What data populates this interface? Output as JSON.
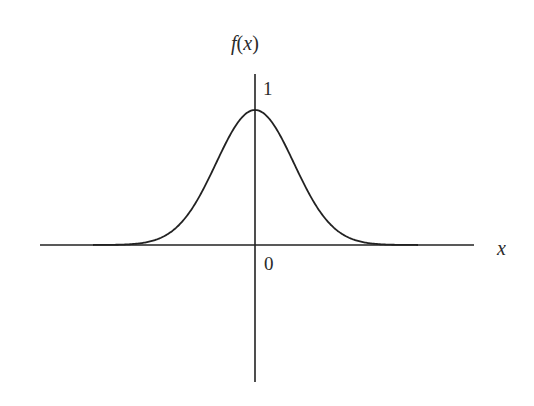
{
  "chart_data": {
    "type": "line",
    "title": "",
    "xlabel": "x",
    "ylabel": "f(x)",
    "function": "f(x) = exp(-x^2) (bell-shaped curve)",
    "peak": {
      "x": 0,
      "y": 1
    },
    "tick_labels": {
      "origin": "0",
      "peak": "1"
    },
    "x": [
      -3,
      -2.5,
      -2,
      -1.5,
      -1,
      -0.5,
      0,
      0.5,
      1,
      1.5,
      2,
      2.5,
      3
    ],
    "series": [
      {
        "name": "f(x)",
        "values": [
          0.0001,
          0.0019,
          0.018,
          0.105,
          0.368,
          0.779,
          1.0,
          0.779,
          0.368,
          0.105,
          0.018,
          0.0019,
          0.0001
        ]
      }
    ],
    "xlim": [
      -4.2,
      4.2
    ],
    "ylim": [
      -1.0,
      1.2
    ],
    "grid": false,
    "legend": "none",
    "colors": {
      "curve": "#222222",
      "axes": "#222222",
      "background": "#ffffff"
    }
  },
  "labels": {
    "y_axis": "f(x)",
    "x_axis": "x",
    "origin": "0",
    "peak_value": "1"
  }
}
